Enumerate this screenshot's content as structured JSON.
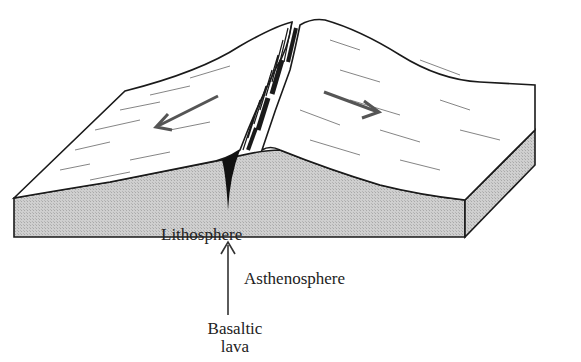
{
  "diagram": {
    "type": "block diagram",
    "labels": {
      "lithosphere": "Lithosphere",
      "asthenosphere": "Asthenosphere",
      "basaltic_lava_line1": "Basaltic",
      "basaltic_lava_line2": "lava"
    },
    "arrows": [
      {
        "name": "spreading-left",
        "direction": "left-down"
      },
      {
        "name": "spreading-right",
        "direction": "right-down"
      },
      {
        "name": "magma-upwelling",
        "direction": "up"
      }
    ],
    "colors": {
      "outline": "#1a1a1a",
      "block_side": "#c8c8c8",
      "surface": "#ffffff",
      "arrow": "#555555"
    }
  }
}
